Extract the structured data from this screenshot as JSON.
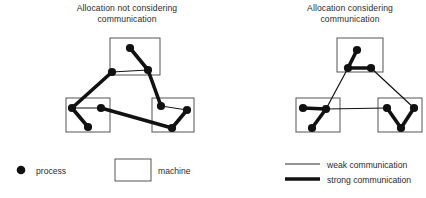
{
  "figure": {
    "type": "diagram",
    "width": 426,
    "height": 198,
    "background": "#ffffff",
    "colors": {
      "node": "#111111",
      "strong_edge": "#111111",
      "weak_edge": "#2b2b2b",
      "machine_border": "#555555",
      "text": "#2b2b2b"
    }
  },
  "panels": [
    {
      "id": "left",
      "title": "Allocation not considering communication",
      "title_lines": [
        "Allocation not considering",
        "communication"
      ],
      "machines": [
        {
          "id": "m-top",
          "x": 110,
          "y": 38,
          "w": 50,
          "h": 37
        },
        {
          "id": "m-bottom-left",
          "x": 66,
          "y": 98,
          "w": 44,
          "h": 34
        },
        {
          "id": "m-bottom-right",
          "x": 152,
          "y": 98,
          "w": 42,
          "h": 34
        }
      ],
      "processes": [
        {
          "id": "p1",
          "x": 130,
          "y": 48
        },
        {
          "id": "p2",
          "x": 148,
          "y": 70
        },
        {
          "id": "p3",
          "x": 112,
          "y": 72
        },
        {
          "id": "p4",
          "x": 72,
          "y": 108
        },
        {
          "id": "p5",
          "x": 88,
          "y": 127
        },
        {
          "id": "p6",
          "x": 101,
          "y": 108
        },
        {
          "id": "p7",
          "x": 161,
          "y": 106
        },
        {
          "id": "p8",
          "x": 187,
          "y": 110
        },
        {
          "id": "p9",
          "x": 172,
          "y": 128
        }
      ],
      "edges": [
        {
          "from": "p1",
          "to": "p2",
          "strength": "strong"
        },
        {
          "from": "p3",
          "to": "p2",
          "strength": "weak"
        },
        {
          "from": "p3",
          "to": "p4",
          "strength": "strong"
        },
        {
          "from": "p4",
          "to": "p5",
          "strength": "strong"
        },
        {
          "from": "p4",
          "to": "p6",
          "strength": "weak"
        },
        {
          "from": "p6",
          "to": "p9",
          "strength": "strong"
        },
        {
          "from": "p2",
          "to": "p7",
          "strength": "strong"
        },
        {
          "from": "p7",
          "to": "p8",
          "strength": "weak"
        },
        {
          "from": "p8",
          "to": "p9",
          "strength": "strong"
        }
      ]
    },
    {
      "id": "right",
      "title": "Allocation considering communication",
      "title_lines": [
        "Allocation considering",
        "communication"
      ],
      "machines": [
        {
          "id": "m-top",
          "x": 337,
          "y": 38,
          "w": 46,
          "h": 34
        },
        {
          "id": "m-bottom-left",
          "x": 296,
          "y": 98,
          "w": 44,
          "h": 34
        },
        {
          "id": "m-bottom-right",
          "x": 378,
          "y": 98,
          "w": 44,
          "h": 34
        }
      ],
      "processes": [
        {
          "id": "q1",
          "x": 357,
          "y": 50
        },
        {
          "id": "q2",
          "x": 348,
          "y": 68
        },
        {
          "id": "q3",
          "x": 371,
          "y": 68
        },
        {
          "id": "q4",
          "x": 303,
          "y": 108
        },
        {
          "id": "q5",
          "x": 326,
          "y": 109
        },
        {
          "id": "q6",
          "x": 312,
          "y": 128
        },
        {
          "id": "q7",
          "x": 387,
          "y": 108
        },
        {
          "id": "q8",
          "x": 414,
          "y": 108
        },
        {
          "id": "q9",
          "x": 401,
          "y": 128
        }
      ],
      "edges": [
        {
          "from": "q1",
          "to": "q2",
          "strength": "strong"
        },
        {
          "from": "q2",
          "to": "q3",
          "strength": "strong"
        },
        {
          "from": "q4",
          "to": "q5",
          "strength": "strong"
        },
        {
          "from": "q5",
          "to": "q6",
          "strength": "strong"
        },
        {
          "from": "q7",
          "to": "q9",
          "strength": "strong"
        },
        {
          "from": "q8",
          "to": "q9",
          "strength": "strong"
        },
        {
          "from": "q2",
          "to": "q5",
          "strength": "weak"
        },
        {
          "from": "q3",
          "to": "q8",
          "strength": "weak"
        },
        {
          "from": "q5",
          "to": "q7",
          "strength": "weak"
        }
      ]
    }
  ],
  "legend": {
    "process_label": "process",
    "machine_label": "machine",
    "weak_label": "weak communication",
    "strong_label": "strong communication",
    "process_symbol": "filled-circle",
    "machine_symbol": "rectangle-outline",
    "weak_symbol": "thin-line",
    "strong_symbol": "thick-line"
  },
  "bottom_strip": {
    "text": ""
  }
}
